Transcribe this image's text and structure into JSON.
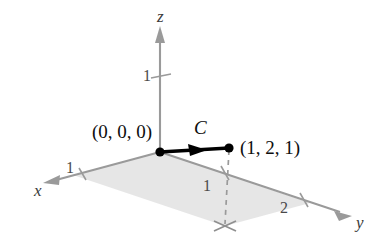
{
  "figure": {
    "type": "3d-coordinate-diagram",
    "background_color": "#ffffff"
  },
  "colors": {
    "axis": "#9a9a9a",
    "curve": "#000000",
    "plane_fill": "#e3e3e3",
    "plane_edge": "#b4b4b4",
    "dashed": "#9a9a9a",
    "text": "#1a1a1a"
  },
  "axes": [
    {
      "name": "x",
      "label": "x",
      "label_x": 34,
      "label_y": 182
    },
    {
      "name": "y",
      "label": "y",
      "label_x": 356,
      "label_y": 214
    },
    {
      "name": "z",
      "label": "z",
      "label_x": 157,
      "label_y": 8
    }
  ],
  "ticks": [
    {
      "name": "z-tick-1",
      "label": "1",
      "x": 143,
      "y": 68
    },
    {
      "name": "x-tick-1",
      "label": "1",
      "x": 66,
      "y": 160
    },
    {
      "name": "y-tick-1",
      "label": "1",
      "x": 203,
      "y": 178
    },
    {
      "name": "y-tick-2",
      "label": "2",
      "x": 280,
      "y": 200
    }
  ],
  "points": [
    {
      "name": "origin-point",
      "label": "(0, 0, 0)",
      "label_x": 92,
      "label_y": 122,
      "dot_x": 160,
      "dot_y": 152
    },
    {
      "name": "endpoint-point",
      "label": "(1, 2, 1)",
      "label_x": 240,
      "label_y": 138,
      "dot_x": 229,
      "dot_y": 148
    }
  ],
  "curve": {
    "name": "curve-c",
    "label": "C",
    "label_x": 194,
    "label_y": 118,
    "from": [
      160,
      152
    ],
    "to": [
      229,
      148
    ],
    "oriented": true
  }
}
